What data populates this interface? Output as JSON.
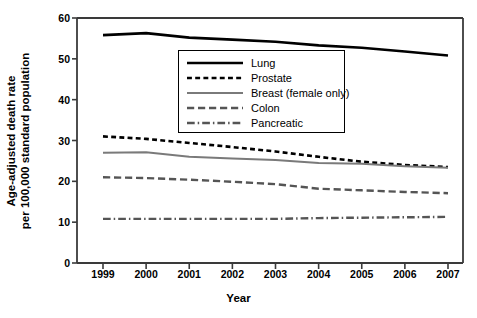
{
  "chart_data": {
    "type": "line",
    "title": "",
    "xlabel": "Year",
    "ylabel_lines": [
      "Age-adjusted death rate",
      "per 100,000 standard population"
    ],
    "ylabel": "Age-adjusted death rate per 100,000 standard population",
    "x": [
      1999,
      2000,
      2001,
      2002,
      2003,
      2004,
      2005,
      2006,
      2007
    ],
    "categories": [
      "1999",
      "2000",
      "2001",
      "2002",
      "2003",
      "2004",
      "2005",
      "2006",
      "2007"
    ],
    "xlim": [
      1999,
      2007
    ],
    "ylim": [
      0,
      60
    ],
    "yticks": [
      0,
      10,
      20,
      30,
      40,
      50,
      60
    ],
    "ytick_labels": [
      "0",
      "10",
      "20",
      "30",
      "40",
      "50",
      "60"
    ],
    "grid": false,
    "legend_position": "upper-center",
    "series": [
      {
        "name": "Lung",
        "style": "solid",
        "color": "#000000",
        "width": 2.6,
        "values": [
          55.8,
          56.3,
          55.2,
          54.7,
          54.2,
          53.3,
          52.7,
          51.8,
          50.8
        ]
      },
      {
        "name": "Prostate",
        "style": "dotted",
        "color": "#000000",
        "width": 2.6,
        "values": [
          31.0,
          30.4,
          29.4,
          28.4,
          27.3,
          26.0,
          24.8,
          24.0,
          23.5
        ]
      },
      {
        "name": "Breast (female only)",
        "style": "solid",
        "color": "#7a7a7a",
        "width": 2.0,
        "values": [
          27.0,
          27.1,
          26.0,
          25.6,
          25.2,
          24.5,
          24.3,
          23.7,
          23.3
        ]
      },
      {
        "name": "Colon",
        "style": "dashed",
        "color": "#555555",
        "width": 2.4,
        "values": [
          21.0,
          20.8,
          20.4,
          19.9,
          19.3,
          18.2,
          17.8,
          17.4,
          17.1
        ]
      },
      {
        "name": "Pancreatic",
        "style": "dashdot",
        "color": "#555555",
        "width": 2.4,
        "values": [
          10.8,
          10.8,
          10.8,
          10.8,
          10.8,
          11.0,
          11.1,
          11.2,
          11.3
        ]
      }
    ]
  },
  "axis": {
    "x_title": "Year",
    "y_title_line1": "Age-adjusted death rate",
    "y_title_line2": "per 100,000 standard population"
  },
  "legend": {
    "items": [
      {
        "label": "Lung"
      },
      {
        "label": "Prostate"
      },
      {
        "label": "Breast (female only)"
      },
      {
        "label": "Colon"
      },
      {
        "label": "Pancreatic"
      }
    ]
  },
  "colors": {
    "axis": "#3a3a3a",
    "black_series": "#000000",
    "gray_series": "#7a7a7a",
    "dark_gray_series": "#555555",
    "background": "#ffffff"
  }
}
